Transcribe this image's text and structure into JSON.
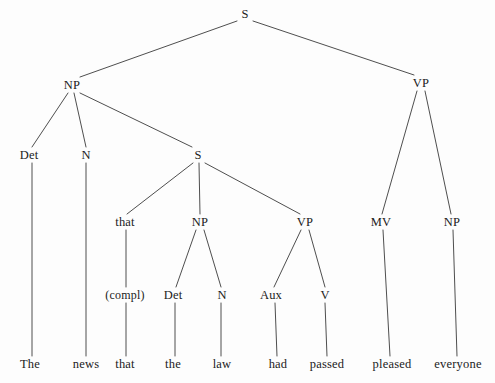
{
  "diagram": {
    "type": "syntax-tree",
    "sentence": "The news that the law had passed pleased everyone",
    "stroke_color": "#3a3a3a",
    "text_color": "#1b1b1b",
    "background_color": "#fdfdfd",
    "nodes": [
      {
        "id": "s-root",
        "label": "S",
        "x": 245,
        "y": 14,
        "kind": "cat"
      },
      {
        "id": "np-subject",
        "label": "NP",
        "x": 72,
        "y": 85,
        "kind": "cat"
      },
      {
        "id": "vp-main",
        "label": "VP",
        "x": 421,
        "y": 83,
        "kind": "cat"
      },
      {
        "id": "det-1",
        "label": "Det",
        "x": 29,
        "y": 155,
        "kind": "cat"
      },
      {
        "id": "n-1",
        "label": "N",
        "x": 86,
        "y": 155,
        "kind": "cat"
      },
      {
        "id": "s-embedded",
        "label": "S",
        "x": 198,
        "y": 155,
        "kind": "cat"
      },
      {
        "id": "compl-that",
        "label": "that",
        "x": 125,
        "y": 222,
        "kind": "cat"
      },
      {
        "id": "np-embedded",
        "label": "NP",
        "x": 200,
        "y": 222,
        "kind": "cat"
      },
      {
        "id": "vp-embedded",
        "label": "VP",
        "x": 305,
        "y": 222,
        "kind": "cat"
      },
      {
        "id": "mv",
        "label": "MV",
        "x": 381,
        "y": 222,
        "kind": "cat"
      },
      {
        "id": "np-object",
        "label": "NP",
        "x": 452,
        "y": 222,
        "kind": "cat"
      },
      {
        "id": "compl-gloss",
        "label": "(compl)",
        "x": 125,
        "y": 295,
        "kind": "compl"
      },
      {
        "id": "det-2",
        "label": "Det",
        "x": 173,
        "y": 295,
        "kind": "cat"
      },
      {
        "id": "n-2",
        "label": "N",
        "x": 222,
        "y": 295,
        "kind": "cat"
      },
      {
        "id": "aux",
        "label": "Aux",
        "x": 271,
        "y": 295,
        "kind": "cat"
      },
      {
        "id": "v",
        "label": "V",
        "x": 325,
        "y": 295,
        "kind": "cat"
      },
      {
        "id": "word-the-1",
        "label": "The",
        "x": 30,
        "y": 364,
        "kind": "leaf"
      },
      {
        "id": "word-news",
        "label": "news",
        "x": 86,
        "y": 364,
        "kind": "leaf"
      },
      {
        "id": "word-that",
        "label": "that",
        "x": 125,
        "y": 364,
        "kind": "leaf"
      },
      {
        "id": "word-the-2",
        "label": "the",
        "x": 173,
        "y": 364,
        "kind": "leaf"
      },
      {
        "id": "word-law",
        "label": "law",
        "x": 222,
        "y": 364,
        "kind": "leaf"
      },
      {
        "id": "word-had",
        "label": "had",
        "x": 278,
        "y": 364,
        "kind": "leaf"
      },
      {
        "id": "word-passed",
        "label": "passed",
        "x": 327,
        "y": 364,
        "kind": "leaf"
      },
      {
        "id": "word-pleased",
        "label": "pleased",
        "x": 392,
        "y": 364,
        "kind": "leaf"
      },
      {
        "id": "word-everyone",
        "label": "everyone",
        "x": 458,
        "y": 364,
        "kind": "leaf"
      }
    ],
    "edges": [
      {
        "from": "s-root",
        "to": "np-subject",
        "x1": 237,
        "y1": 21,
        "x2": 80,
        "y2": 77
      },
      {
        "from": "s-root",
        "to": "vp-main",
        "x1": 253,
        "y1": 21,
        "x2": 414,
        "y2": 75
      },
      {
        "from": "np-subject",
        "to": "det-1",
        "x1": 68,
        "y1": 93,
        "x2": 32,
        "y2": 147
      },
      {
        "from": "np-subject",
        "to": "n-1",
        "x1": 74,
        "y1": 93,
        "x2": 86,
        "y2": 147
      },
      {
        "from": "np-subject",
        "to": "s-embedded",
        "x1": 80,
        "y1": 93,
        "x2": 192,
        "y2": 147
      },
      {
        "from": "vp-main",
        "to": "mv",
        "x1": 417,
        "y1": 91,
        "x2": 382,
        "y2": 214
      },
      {
        "from": "vp-main",
        "to": "np-object",
        "x1": 425,
        "y1": 91,
        "x2": 451,
        "y2": 214
      },
      {
        "from": "s-embedded",
        "to": "compl-that",
        "x1": 193,
        "y1": 163,
        "x2": 127,
        "y2": 214
      },
      {
        "from": "s-embedded",
        "to": "np-embedded",
        "x1": 199,
        "y1": 163,
        "x2": 200,
        "y2": 214
      },
      {
        "from": "s-embedded",
        "to": "vp-embedded",
        "x1": 205,
        "y1": 163,
        "x2": 300,
        "y2": 214
      },
      {
        "from": "np-embedded",
        "to": "det-2",
        "x1": 196,
        "y1": 230,
        "x2": 176,
        "y2": 287
      },
      {
        "from": "np-embedded",
        "to": "n-2",
        "x1": 204,
        "y1": 230,
        "x2": 221,
        "y2": 287
      },
      {
        "from": "vp-embedded",
        "to": "aux",
        "x1": 301,
        "y1": 230,
        "x2": 274,
        "y2": 287
      },
      {
        "from": "vp-embedded",
        "to": "v",
        "x1": 309,
        "y1": 230,
        "x2": 325,
        "y2": 287
      },
      {
        "from": "compl-that",
        "to": "compl-gloss",
        "x1": 126,
        "y1": 230,
        "x2": 126,
        "y2": 287
      },
      {
        "from": "det-1",
        "to": "word-the-1",
        "x1": 32,
        "y1": 163,
        "x2": 32,
        "y2": 356
      },
      {
        "from": "n-1",
        "to": "word-news",
        "x1": 86,
        "y1": 163,
        "x2": 86,
        "y2": 356
      },
      {
        "from": "compl-gloss",
        "to": "word-that",
        "x1": 126,
        "y1": 303,
        "x2": 126,
        "y2": 356
      },
      {
        "from": "det-2",
        "to": "word-the-2",
        "x1": 175,
        "y1": 303,
        "x2": 175,
        "y2": 356
      },
      {
        "from": "n-2",
        "to": "word-law",
        "x1": 221,
        "y1": 303,
        "x2": 221,
        "y2": 356
      },
      {
        "from": "aux",
        "to": "word-had",
        "x1": 275,
        "y1": 303,
        "x2": 277,
        "y2": 356
      },
      {
        "from": "v",
        "to": "word-passed",
        "x1": 325,
        "y1": 303,
        "x2": 327,
        "y2": 356
      },
      {
        "from": "mv",
        "to": "word-pleased",
        "x1": 383,
        "y1": 230,
        "x2": 390,
        "y2": 356
      },
      {
        "from": "np-object",
        "to": "word-everyone",
        "x1": 453,
        "y1": 230,
        "x2": 457,
        "y2": 356
      }
    ]
  }
}
